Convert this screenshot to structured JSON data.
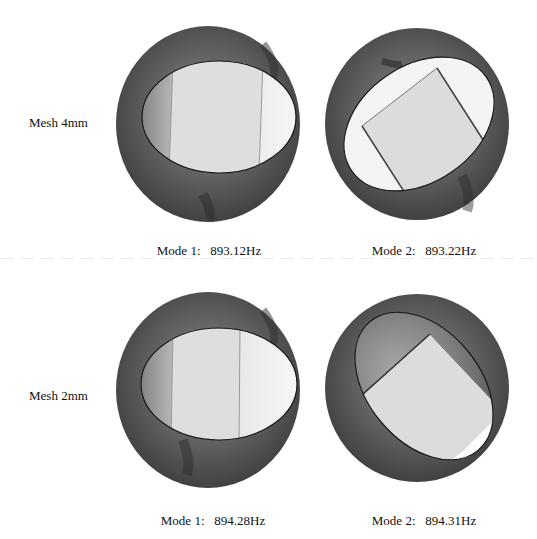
{
  "figure": {
    "rows": [
      {
        "label": "Mesh 4mm",
        "panels": [
          {
            "mode": "Mode 1:",
            "frequency": "893.12Hz",
            "caption": "Mode 1:   893.12Hz"
          },
          {
            "mode": "Mode 2:",
            "frequency": "893.22Hz",
            "caption": "Mode 2:   893.22Hz"
          }
        ]
      },
      {
        "label": "Mesh 2mm",
        "panels": [
          {
            "mode": "Mode 1:",
            "frequency": "894.28Hz",
            "caption": "Mode 1:   894.28Hz"
          },
          {
            "mode": "Mode 2:",
            "frequency": "894.31Hz",
            "caption": "Mode 2:   894.31Hz"
          }
        ]
      }
    ],
    "colors": {
      "disc_dark": "#3a3a3a",
      "disc_mid": "#6a6a6a",
      "inner_light": "#f2f2f2",
      "inner_flat": "#dcdcdc",
      "outline": "#1a1a1a"
    }
  }
}
